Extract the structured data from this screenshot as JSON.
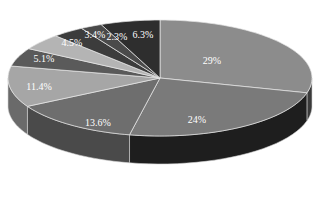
{
  "chart_data": {
    "type": "pie",
    "style": "3d",
    "title": "",
    "start_angle": "12 o'clock, clockwise",
    "slices": [
      {
        "label": "29%",
        "value": 29.0,
        "color": "#8c8c8c",
        "side": "#3a3a3a"
      },
      {
        "label": "24%",
        "value": 24.0,
        "color": "#7a7a7a",
        "side": "#1e1e1e"
      },
      {
        "label": "13.6%",
        "value": 13.6,
        "color": "#6e6e6e",
        "side": "#4a4a4a"
      },
      {
        "label": "11.4%",
        "value": 11.4,
        "color": "#a6a6a6",
        "side": "#6a6a6a"
      },
      {
        "label": "5.1%",
        "value": 5.1,
        "color": "#5a5a5a",
        "side": "#3a3a3a"
      },
      {
        "label": "4.5%",
        "value": 4.5,
        "color": "#b4b4b4",
        "side": "#808080"
      },
      {
        "label": "3.4%",
        "value": 3.4,
        "color": "#3c3c3c",
        "side": "#2a2a2a"
      },
      {
        "label": "2.3%",
        "value": 2.3,
        "color": "#4a4a4a",
        "side": "#2a2a2a"
      },
      {
        "label": "6.3%",
        "value": 6.3,
        "color": "#2e2e2e",
        "side": "#1e1e1e"
      }
    ],
    "legend": null
  }
}
